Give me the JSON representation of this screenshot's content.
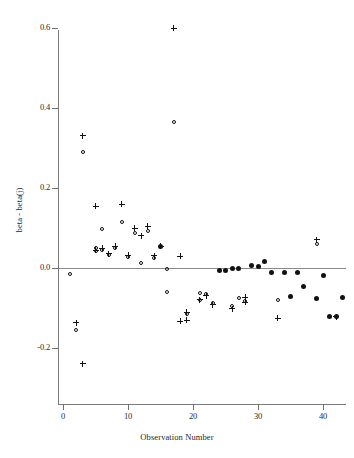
{
  "chart_data": {
    "type": "scatter",
    "title": "",
    "xlabel": "Observation Number",
    "ylabel": "beta - beta(j)",
    "xlim": [
      -1,
      45
    ],
    "ylim": [
      -0.28,
      0.64
    ],
    "xticks": [
      0,
      10,
      20,
      30,
      40
    ],
    "xtick_labels": [
      "0",
      "10",
      "20",
      "30",
      "40"
    ],
    "yticks": [
      -0.2,
      0.0,
      0.2,
      0.4,
      0.6
    ],
    "ytick_labels": [
      "-0.2",
      "0.0",
      "0.2",
      "0.4",
      "0.6"
    ],
    "grid": false,
    "legend": "none",
    "reference_line": {
      "orientation": "horizontal",
      "y": 0.0,
      "color": "#8a8a8a"
    },
    "series": [
      {
        "name": "plus",
        "marker": "plus",
        "color": "#111111",
        "points": [
          {
            "x": 2,
            "y": -0.137
          },
          {
            "x": 3,
            "y": 0.331
          },
          {
            "x": 3,
            "y": -0.239
          },
          {
            "x": 5,
            "y": 0.155
          },
          {
            "x": 5,
            "y": 0.045
          },
          {
            "x": 6,
            "y": 0.049
          },
          {
            "x": 7,
            "y": 0.036
          },
          {
            "x": 8,
            "y": 0.055
          },
          {
            "x": 9,
            "y": 0.16
          },
          {
            "x": 10,
            "y": 0.032
          },
          {
            "x": 11,
            "y": 0.1
          },
          {
            "x": 12,
            "y": 0.081
          },
          {
            "x": 13,
            "y": 0.104
          },
          {
            "x": 14,
            "y": 0.031
          },
          {
            "x": 15,
            "y": 0.054
          },
          {
            "x": 17,
            "y": 0.6
          },
          {
            "x": 18,
            "y": 0.029
          },
          {
            "x": 18,
            "y": -0.133
          },
          {
            "x": 19,
            "y": -0.13
          },
          {
            "x": 19,
            "y": -0.111
          },
          {
            "x": 21,
            "y": -0.079
          },
          {
            "x": 22,
            "y": -0.069
          },
          {
            "x": 23,
            "y": -0.092
          },
          {
            "x": 26,
            "y": -0.102
          },
          {
            "x": 28,
            "y": -0.073
          },
          {
            "x": 28,
            "y": -0.086
          },
          {
            "x": 33,
            "y": -0.126
          },
          {
            "x": 39,
            "y": 0.071
          },
          {
            "x": 42,
            "y": -0.122
          }
        ]
      },
      {
        "name": "open-circle",
        "marker": "open-circle",
        "color": "#111111",
        "points": [
          {
            "x": 1,
            "y": -0.014
          },
          {
            "x": 2,
            "y": -0.156
          },
          {
            "x": 3,
            "y": 0.289
          },
          {
            "x": 5,
            "y": 0.042
          },
          {
            "x": 5,
            "y": 0.049
          },
          {
            "x": 6,
            "y": 0.097
          },
          {
            "x": 6,
            "y": 0.046
          },
          {
            "x": 7,
            "y": 0.032
          },
          {
            "x": 8,
            "y": 0.051
          },
          {
            "x": 9,
            "y": 0.114
          },
          {
            "x": 10,
            "y": 0.028
          },
          {
            "x": 11,
            "y": 0.088
          },
          {
            "x": 12,
            "y": 0.013
          },
          {
            "x": 13,
            "y": 0.093
          },
          {
            "x": 14,
            "y": 0.026
          },
          {
            "x": 16,
            "y": -0.003
          },
          {
            "x": 16,
            "y": -0.059
          },
          {
            "x": 17,
            "y": 0.366
          },
          {
            "x": 19,
            "y": -0.114
          },
          {
            "x": 21,
            "y": -0.062
          },
          {
            "x": 21,
            "y": -0.08
          },
          {
            "x": 22,
            "y": -0.066
          },
          {
            "x": 23,
            "y": -0.088
          },
          {
            "x": 26,
            "y": -0.096
          },
          {
            "x": 27,
            "y": -0.076
          },
          {
            "x": 28,
            "y": -0.082
          },
          {
            "x": 33,
            "y": -0.08
          },
          {
            "x": 39,
            "y": 0.06
          }
        ]
      },
      {
        "name": "filled-circle",
        "marker": "filled-circle",
        "color": "#111111",
        "points": [
          {
            "x": 15,
            "y": 0.054
          },
          {
            "x": 24,
            "y": -0.006
          },
          {
            "x": 25,
            "y": -0.005
          },
          {
            "x": 26,
            "y": -0.002
          },
          {
            "x": 27,
            "y": -0.001
          },
          {
            "x": 29,
            "y": 0.006
          },
          {
            "x": 30,
            "y": 0.005
          },
          {
            "x": 31,
            "y": 0.017
          },
          {
            "x": 32,
            "y": -0.012
          },
          {
            "x": 34,
            "y": -0.012
          },
          {
            "x": 35,
            "y": -0.072
          },
          {
            "x": 36,
            "y": -0.012
          },
          {
            "x": 37,
            "y": -0.047
          },
          {
            "x": 39,
            "y": -0.076
          },
          {
            "x": 40,
            "y": -0.019
          },
          {
            "x": 41,
            "y": -0.12
          },
          {
            "x": 42,
            "y": -0.12
          },
          {
            "x": 43,
            "y": -0.074
          }
        ]
      }
    ]
  }
}
